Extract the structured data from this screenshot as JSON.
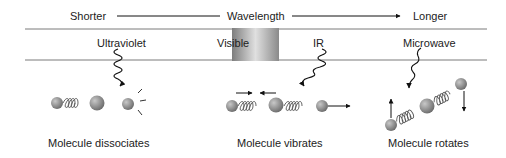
{
  "header": {
    "left_label": "Shorter",
    "center_label": "Wavelength",
    "right_label": "Longer"
  },
  "bands": {
    "ultraviolet": "Ultraviolet",
    "visible": "Visible",
    "ir": "IR",
    "microwave": "Microwave"
  },
  "effects": {
    "ultraviolet": "Molecule dissociates",
    "ir": "Molecule vibrates",
    "microwave": "Molecule rotates"
  },
  "colors": {
    "line": "#7a7a7a",
    "atom": "#8a8a8a",
    "text": "#222222"
  }
}
